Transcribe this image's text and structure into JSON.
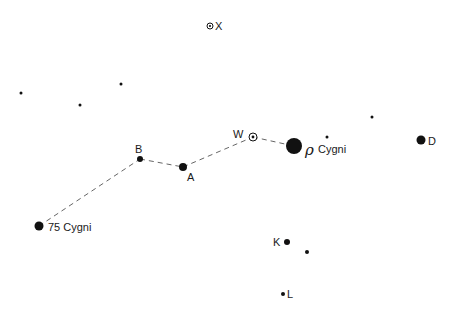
{
  "diagram": {
    "title": "",
    "colors": {
      "star": "#111111",
      "line": "#555555",
      "text": "#1a1a1a",
      "background": "#ffffff"
    },
    "stars": [
      {
        "id": "X",
        "x": 210,
        "y": 26,
        "r": 3,
        "type": "ringed",
        "label": "X"
      },
      {
        "id": "W",
        "x": 253,
        "y": 137,
        "r": 4,
        "type": "ringed",
        "label": "W"
      },
      {
        "id": "rho",
        "x": 294,
        "y": 146,
        "r": 8,
        "type": "filled",
        "label": "Cygni",
        "greek": "ρ"
      },
      {
        "id": "A",
        "x": 183,
        "y": 167,
        "r": 4,
        "type": "filled",
        "label": "A"
      },
      {
        "id": "B",
        "x": 140,
        "y": 159,
        "r": 3,
        "type": "filled",
        "label": "B"
      },
      {
        "id": "75Cyg",
        "x": 39,
        "y": 226,
        "r": 4.5,
        "type": "filled",
        "label": "75 Cygni"
      },
      {
        "id": "D",
        "x": 421,
        "y": 140,
        "r": 4.5,
        "type": "filled",
        "label": "D"
      },
      {
        "id": "K",
        "x": 287,
        "y": 242,
        "r": 3,
        "type": "filled",
        "label": "K"
      },
      {
        "id": "L",
        "x": 283,
        "y": 294,
        "r": 2,
        "type": "filled",
        "label": "L"
      },
      {
        "id": "f1",
        "x": 21,
        "y": 93,
        "r": 1.5,
        "type": "filled",
        "label": ""
      },
      {
        "id": "f2",
        "x": 80,
        "y": 105,
        "r": 1.5,
        "type": "filled",
        "label": ""
      },
      {
        "id": "f3",
        "x": 121,
        "y": 84,
        "r": 1.5,
        "type": "filled",
        "label": ""
      },
      {
        "id": "f4",
        "x": 327,
        "y": 137,
        "r": 1.5,
        "type": "filled",
        "label": ""
      },
      {
        "id": "f5",
        "x": 372,
        "y": 117,
        "r": 1.5,
        "type": "filled",
        "label": ""
      },
      {
        "id": "f6",
        "x": 307,
        "y": 252,
        "r": 2,
        "type": "filled",
        "label": ""
      }
    ],
    "labels": [
      {
        "text": "X",
        "x": 215,
        "y": 30
      },
      {
        "text": "W",
        "x": 233,
        "y": 138
      },
      {
        "text": "Cygni",
        "x": 318,
        "y": 153
      },
      {
        "text": "A",
        "x": 187,
        "y": 181
      },
      {
        "text": "B",
        "x": 135,
        "y": 153
      },
      {
        "text": "75 Cygni",
        "x": 48,
        "y": 231
      },
      {
        "text": "D",
        "x": 428,
        "y": 145
      },
      {
        "text": "K",
        "x": 273,
        "y": 246
      },
      {
        "text": "L",
        "x": 287,
        "y": 298
      }
    ],
    "rho_symbol": {
      "text": "ρ",
      "x": 305,
      "y": 155
    },
    "path": [
      {
        "from": "75Cyg",
        "to": "B"
      },
      {
        "from": "B",
        "to": "A"
      },
      {
        "from": "A",
        "to": "W"
      },
      {
        "from": "W",
        "to": "rho"
      }
    ]
  }
}
